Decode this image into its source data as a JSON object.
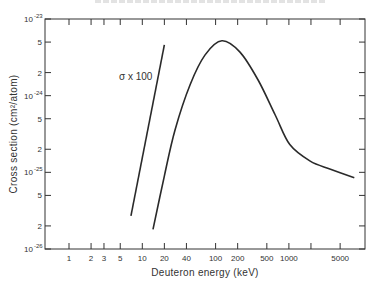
{
  "chart_data": {
    "type": "line",
    "title": "",
    "xlabel": "Deuteron energy (keV)",
    "ylabel": "Cross section (cm²/atom)",
    "xscale": "log",
    "yscale": "log",
    "xlim": [
      0.45,
      8500
    ],
    "ylim": [
      1e-26,
      1e-23
    ],
    "grid": false,
    "legend": null,
    "x_ticks": [
      {
        "value": 1,
        "label": "1"
      },
      {
        "value": 2,
        "label": "2"
      },
      {
        "value": 3,
        "label": "3"
      },
      {
        "value": 5,
        "label": "5"
      },
      {
        "value": 10,
        "label": "10"
      },
      {
        "value": 20,
        "label": "20"
      },
      {
        "value": 40,
        "label": "40"
      },
      {
        "value": 100,
        "label": "100"
      },
      {
        "value": 200,
        "label": "200"
      },
      {
        "value": 500,
        "label": "500"
      },
      {
        "value": 1000,
        "label": "1000"
      },
      {
        "value": 2000,
        "label": ""
      },
      {
        "value": 5000,
        "label": "5000"
      }
    ],
    "y_ticks": [
      {
        "value": 1e-23,
        "label_base": "10",
        "label_exp": "-23"
      },
      {
        "value": 5e-24,
        "label_base": "5",
        "label_exp": ""
      },
      {
        "value": 2e-24,
        "label_base": "2",
        "label_exp": ""
      },
      {
        "value": 1e-24,
        "label_base": "10",
        "label_exp": "-24"
      },
      {
        "value": 5e-25,
        "label_base": "5",
        "label_exp": ""
      },
      {
        "value": 2e-25,
        "label_base": "2",
        "label_exp": ""
      },
      {
        "value": 1e-25,
        "label_base": "10",
        "label_exp": "-25"
      },
      {
        "value": 5e-26,
        "label_base": "5",
        "label_exp": ""
      },
      {
        "value": 2e-26,
        "label_base": "2",
        "label_exp": ""
      },
      {
        "value": 1e-26,
        "label_base": "10",
        "label_exp": "-26"
      }
    ],
    "series": [
      {
        "name": "σ x 100",
        "x": [
          7,
          20
        ],
        "values": [
          2.7e-26,
          4.6e-24
        ]
      },
      {
        "name": "σ",
        "x": [
          14,
          20,
          28,
          45,
          72,
          122,
          215,
          380,
          650,
          1030,
          1950,
          3700,
          7800
        ],
        "values": [
          1.8e-26,
          9e-26,
          3.6e-25,
          1.4e-24,
          3.4e-24,
          5.2e-24,
          3.7e-24,
          1.6e-24,
          5.6e-25,
          2.3e-25,
          1.4e-25,
          1.1e-25,
          8.5e-26
        ]
      }
    ],
    "annotations": [
      {
        "text": "σ x 100",
        "near_series": "σ x 100"
      }
    ]
  }
}
